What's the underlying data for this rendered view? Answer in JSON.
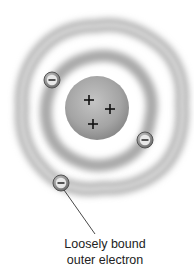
{
  "diagram": {
    "nucleus": {
      "charge_symbol": "+",
      "count": 3
    },
    "electrons": {
      "charge_symbol": "−",
      "count": 3
    },
    "label": {
      "line1": "Loosely bound",
      "line2": "outer electron"
    },
    "colors": {
      "nucleus": "#9a9a9a",
      "electron": "#777777",
      "cloud": "#b5b5b5",
      "text": "#222222"
    }
  }
}
